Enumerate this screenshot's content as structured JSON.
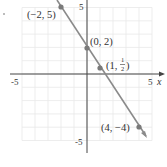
{
  "chart_data": {
    "type": "line",
    "title": "",
    "xlabel": "x",
    "ylabel": "",
    "xlim": [
      -5.5,
      5.5
    ],
    "ylim": [
      -5.5,
      5.5
    ],
    "grid": true,
    "x_tick_labels": [
      "-5",
      "5"
    ],
    "y_tick_labels": [
      "5",
      "-5"
    ],
    "line": {
      "slope": -1.5,
      "intercept": 2,
      "equation": "y = -3/2 x + 2"
    },
    "points": [
      {
        "x": -2,
        "y": 5,
        "label": "(−2, 5)"
      },
      {
        "x": 0,
        "y": 2,
        "label": "(0, 2)"
      },
      {
        "x": 1,
        "y": 0.5,
        "label_prefix": "(1, ",
        "label_num": "1",
        "label_den": "2",
        "label_suffix": ")"
      },
      {
        "x": 4,
        "y": -4,
        "label": "(4, −4)"
      }
    ],
    "colors": {
      "line": "#8a8a8a",
      "point": "#7a7a7a",
      "grid": "#e6e6e6",
      "axis": "#444444"
    }
  }
}
